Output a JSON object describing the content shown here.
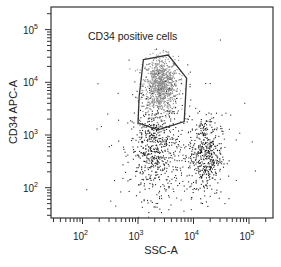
{
  "chart_data": {
    "type": "scatter",
    "subtype": "flow-cytometry-dot-plot",
    "title": "",
    "xlabel": "SSC-A",
    "ylabel": "CD34 APC-A",
    "xscale": "log",
    "yscale": "log",
    "xlim": [
      30,
      200000
    ],
    "ylim": [
      25,
      200000
    ],
    "xticks": [
      {
        "base": "10",
        "exp": "2",
        "value": 100
      },
      {
        "base": "10",
        "exp": "3",
        "value": 1000
      },
      {
        "base": "10",
        "exp": "4",
        "value": 10000
      },
      {
        "base": "10",
        "exp": "5",
        "value": 100000
      }
    ],
    "yticks": [
      {
        "base": "10",
        "exp": "2",
        "value": 100
      },
      {
        "base": "10",
        "exp": "3",
        "value": 1000
      },
      {
        "base": "10",
        "exp": "4",
        "value": 10000
      },
      {
        "base": "10",
        "exp": "5",
        "value": 100000
      }
    ],
    "grid": false,
    "legend": null,
    "gate": {
      "label": "CD34 positive cells",
      "shape": "polygon",
      "vertices_data": [
        [
          1250,
          27000
        ],
        [
          3500,
          33000
        ],
        [
          7500,
          12000
        ],
        [
          6800,
          1800
        ],
        [
          2300,
          1250
        ],
        [
          1000,
          1700
        ],
        [
          1050,
          5500
        ]
      ],
      "color": "#333333"
    },
    "populations": [
      {
        "name": "CD34 positive (gated)",
        "center": [
          2500,
          9000
        ],
        "spread_decades": [
          0.16,
          0.27
        ],
        "count": 900,
        "color": "#8a8a8a"
      },
      {
        "name": "low-SSC CD34-negative",
        "center": [
          2000,
          520
        ],
        "spread_decades": [
          0.22,
          0.45
        ],
        "count": 520,
        "color": "#222222"
      },
      {
        "name": "high-SSC CD34-negative",
        "center": [
          16000,
          420
        ],
        "spread_decades": [
          0.15,
          0.38
        ],
        "count": 420,
        "color": "#1a1a1a"
      },
      {
        "name": "background events",
        "center": [
          4000,
          800
        ],
        "spread_decades": [
          0.55,
          0.7
        ],
        "count": 220,
        "color": "#333333"
      }
    ]
  }
}
